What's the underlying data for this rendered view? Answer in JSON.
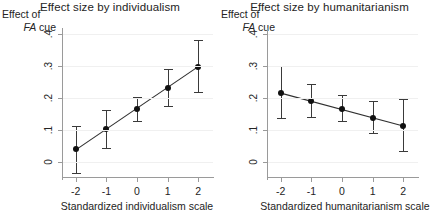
{
  "figure": {
    "y_axis_caption_line1": "Effect of",
    "y_axis_caption_line2_italic": "FA",
    "y_axis_caption_line2_rest": " cue"
  },
  "chart_data": [
    {
      "type": "scatter",
      "panel": "left",
      "title": "Effect size by individualism",
      "xlabel": "Standardized individualism scale",
      "ylabel": "Effect of FA cue",
      "x": [
        -2,
        -1,
        0,
        1,
        2
      ],
      "xticklabels": [
        "-2",
        "-1",
        "0",
        "1",
        "2"
      ],
      "yticks": [
        0,
        0.1,
        0.2,
        0.3,
        0.4
      ],
      "yticklabels": [
        "0",
        ".1",
        ".2",
        ".3",
        ".4"
      ],
      "xlim": [
        -2.45,
        2.45
      ],
      "ylim": [
        -0.05,
        0.42
      ],
      "grid": true,
      "legend": "none",
      "values": [
        0.04,
        0.102,
        0.165,
        0.232,
        0.298
      ],
      "ci_low": [
        -0.035,
        0.045,
        0.128,
        0.175,
        0.218
      ],
      "ci_high": [
        0.113,
        0.163,
        0.205,
        0.293,
        0.382
      ],
      "fit_line": {
        "x": [
          -2,
          2
        ],
        "y": [
          0.038,
          0.299
        ]
      },
      "marker": "filled-circle",
      "errorbar": "capped-vertical"
    },
    {
      "type": "scatter",
      "panel": "right",
      "title": "Effect size by humanitarianism",
      "xlabel": "Standardized humanitarianism scale",
      "ylabel": "Effect of FA cue",
      "x": [
        -2,
        -1,
        0,
        1,
        2
      ],
      "xticklabels": [
        "-2",
        "-1",
        "0",
        "1",
        "2"
      ],
      "yticks": [
        0,
        0.1,
        0.2,
        0.3,
        0.4
      ],
      "yticklabels": [
        "0",
        ".1",
        ".2",
        ".3",
        ".4"
      ],
      "xlim": [
        -2.45,
        2.45
      ],
      "ylim": [
        -0.05,
        0.42
      ],
      "grid": true,
      "legend": "none",
      "values": [
        0.215,
        0.19,
        0.165,
        0.139,
        0.114
      ],
      "ci_low": [
        0.138,
        0.142,
        0.128,
        0.092,
        0.035
      ],
      "ci_high": [
        0.3,
        0.243,
        0.21,
        0.19,
        0.196
      ],
      "fit_line": {
        "x": [
          -2,
          2
        ],
        "y": [
          0.216,
          0.113
        ]
      },
      "marker": "filled-circle",
      "errorbar": "capped-vertical"
    }
  ]
}
